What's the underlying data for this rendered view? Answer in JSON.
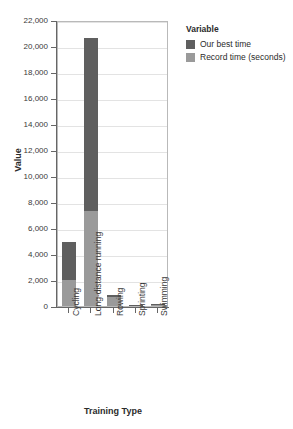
{
  "chart_data": {
    "type": "bar",
    "subtype": "stacked-bar",
    "title": "",
    "xlabel": "Training Type",
    "ylabel": "Value",
    "categories": [
      "Cycling",
      "Long-distance running",
      "Rowing",
      "Sprinting",
      "Swimming"
    ],
    "series": [
      {
        "name": "Record time (seconds)",
        "color": "#9a9a9a",
        "values": [
          2000,
          7300,
          700,
          60,
          150
        ]
      },
      {
        "name": "Our best time",
        "color": "#5f5f5f",
        "values": [
          2900,
          13300,
          150,
          40,
          20
        ]
      }
    ],
    "stack_order_bottom_to_top": [
      "Record time (seconds)",
      "Our best time"
    ],
    "totals": [
      4900,
      20600,
      850,
      100,
      170
    ],
    "ylim": [
      0,
      22000
    ],
    "ytick_step": 2000,
    "yticks": [
      0,
      2000,
      4000,
      6000,
      8000,
      10000,
      12000,
      14000,
      16000,
      18000,
      20000,
      22000
    ],
    "ytick_labels": [
      "0",
      "2,000",
      "4,000",
      "6,000",
      "8,000",
      "10,000",
      "12,000",
      "14,000",
      "16,000",
      "18,000",
      "20,000",
      "22,000"
    ],
    "grid": true,
    "grid_axis": "y",
    "legend_position": "right"
  },
  "legend": {
    "title": "Variable",
    "items": [
      {
        "label": "Our best time",
        "color": "#5f5f5f"
      },
      {
        "label": "Record time (seconds)",
        "color": "#9a9a9a"
      }
    ]
  },
  "axes": {
    "y_title": "Value",
    "x_title": "Training Type"
  },
  "colors": {
    "our_best_time": "#5f5f5f",
    "record_time": "#9a9a9a",
    "grid": "#e3e3e3",
    "panel_border": "#b9b9b9",
    "axis": "#666666",
    "text": "#2b2b2b",
    "background": "#ffffff"
  }
}
